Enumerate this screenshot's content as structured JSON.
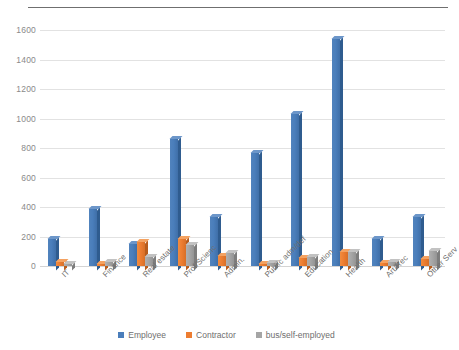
{
  "chart_data": {
    "type": "bar",
    "title": "",
    "xlabel": "",
    "ylabel": "",
    "ylim": [
      0,
      1600
    ],
    "yticks": [
      0,
      200,
      400,
      600,
      800,
      1000,
      1200,
      1400,
      1600
    ],
    "grid": true,
    "legend_position": "bottom",
    "categories": [
      "IT",
      "Finance",
      "Real estate",
      "Prof/Scienc",
      "Admin.",
      "Public adm/def",
      "Education",
      "Health",
      "Art/Rec",
      "Other Serv"
    ],
    "series": [
      {
        "name": "Employee",
        "color": "#4a7ebb",
        "values": [
          180,
          385,
          150,
          860,
          335,
          765,
          1030,
          1540,
          185,
          330
        ]
      },
      {
        "name": "Contractor",
        "color": "#ed7d31",
        "values": [
          30,
          15,
          160,
          180,
          65,
          15,
          55,
          95,
          20,
          45
        ]
      },
      {
        "name": "bus/self-employed",
        "color": "#a5a5a5",
        "values": [
          15,
          25,
          60,
          145,
          85,
          20,
          60,
          95,
          25,
          100
        ]
      }
    ]
  },
  "legend": {
    "items": [
      {
        "label": "Employee",
        "color": "#4a7ebb"
      },
      {
        "label": "Contractor",
        "color": "#ed7d31"
      },
      {
        "label": "bus/self-employed",
        "color": "#a5a5a5"
      }
    ]
  }
}
